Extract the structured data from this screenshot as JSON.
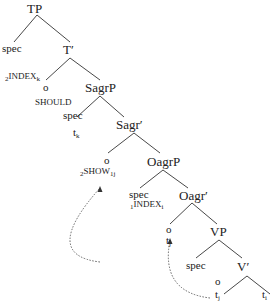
{
  "tree": {
    "nodes": {
      "TP": "TP",
      "spec_tp": "spec",
      "T_bar": "T′",
      "index_k_pre": "2",
      "index_k": "INDEX",
      "index_k_sub": "k",
      "o_t": "o",
      "SagrP": "SagrP",
      "should": "SHOULD",
      "spec_sagr": "spec",
      "t_k": "t",
      "t_k_sub": "k",
      "Sagr_bar": "Sagr′",
      "o_sagr": "o",
      "OagrP": "OagrP",
      "show_pre": "2",
      "show": "SHOW",
      "show_sub": "1j",
      "spec_oagr": "spec",
      "Oagr_bar": "Oagr′",
      "index_i_pre": "1",
      "index_i": "INDEX",
      "index_i_sub": "i",
      "o_oagr": "o",
      "t_j1": "t",
      "t_j1_sub": "j",
      "VP": "VP",
      "spec_vp": "spec",
      "V_bar": "V′",
      "o_v": "o",
      "t_j2": "t",
      "t_j2_sub": "j",
      "t_i": "t",
      "t_i_sub": "i"
    },
    "colors": {
      "line": "#333333",
      "arrow": "#555555"
    }
  }
}
